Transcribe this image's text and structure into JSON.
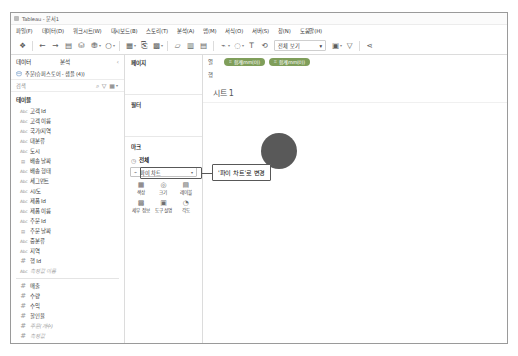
{
  "window": {
    "title": "Tableau - 문서1",
    "logo_icon": "tableau-logo-icon"
  },
  "menubar": {
    "items": [
      {
        "label": "파일(F)"
      },
      {
        "label": "데이터(D)"
      },
      {
        "label": "워크시트(W)"
      },
      {
        "label": "대시보드(B)"
      },
      {
        "label": "스토리(T)"
      },
      {
        "label": "분석(A)"
      },
      {
        "label": "맵(M)"
      },
      {
        "label": "서식(O)"
      },
      {
        "label": "서버(S)"
      },
      {
        "label": "창(N)"
      },
      {
        "label": "도움말(H)"
      }
    ]
  },
  "toolbar": {
    "view_selector_label": "전체 보기",
    "view_selector_caret": "▾",
    "buttons": [
      {
        "name": "tableau-home-icon",
        "glyph": "❖"
      },
      {
        "name": "undo-icon",
        "glyph": "←"
      },
      {
        "name": "redo-icon",
        "glyph": "→"
      },
      {
        "name": "save-icon",
        "glyph": "▤"
      },
      {
        "name": "refresh-data-source-icon",
        "glyph": "⛁"
      },
      {
        "name": "pause-auto-update-icon",
        "glyph": "⛃"
      },
      {
        "name": "run-update-icon",
        "glyph": "○"
      },
      {
        "name": "new-worksheet-icon",
        "glyph": "▦"
      },
      {
        "name": "duplicate-sheet-icon",
        "glyph": "⎘"
      },
      {
        "name": "clear-sheet-icon",
        "glyph": "▩"
      },
      {
        "name": "swap-rows-columns-icon",
        "glyph": "▱"
      },
      {
        "name": "sort-ascending-icon",
        "glyph": "▥"
      },
      {
        "name": "sort-descending-icon",
        "glyph": "▤"
      },
      {
        "name": "highlight-icon",
        "glyph": "⌁"
      },
      {
        "name": "group-members-icon",
        "glyph": "◌"
      },
      {
        "name": "show-mark-labels-icon",
        "glyph": "T"
      },
      {
        "name": "fix-axes-icon",
        "glyph": "⟲"
      },
      {
        "name": "presentation-mode-icon",
        "glyph": "▣"
      },
      {
        "name": "show-me-icon",
        "glyph": "▽"
      },
      {
        "name": "share-icon",
        "glyph": "⋖"
      }
    ]
  },
  "data_pane": {
    "tabs": [
      {
        "label": "데이터",
        "active": true
      },
      {
        "label": "분석",
        "active": false
      }
    ],
    "collapse_icon": "‹",
    "data_source": {
      "icon": "data-source-icon",
      "label": "주문(슈퍼스토어 - 샘플 (4))"
    },
    "search": {
      "label": "검색",
      "search_icon": "⌕",
      "filter_icon": "▽",
      "group_icon": "▦",
      "menu_caret": "▾"
    },
    "fields_header": "테이블",
    "fields": [
      {
        "label": "고객 Id",
        "type": "abc"
      },
      {
        "label": "고객 이름",
        "type": "abc"
      },
      {
        "label": "국가/지역",
        "type": "abc"
      },
      {
        "label": "대분류",
        "type": "abc"
      },
      {
        "label": "도시",
        "type": "abc"
      },
      {
        "label": "배송 날짜",
        "type": "date"
      },
      {
        "label": "배송 형태",
        "type": "abc"
      },
      {
        "label": "세그먼트",
        "type": "abc"
      },
      {
        "label": "시/도",
        "type": "abc"
      },
      {
        "label": "제품 Id",
        "type": "abc"
      },
      {
        "label": "제품 이름",
        "type": "abc"
      },
      {
        "label": "주문 Id",
        "type": "abc"
      },
      {
        "label": "주문 날짜",
        "type": "date"
      },
      {
        "label": "중분류",
        "type": "abc"
      },
      {
        "label": "지역",
        "type": "abc"
      },
      {
        "label": "행 Id",
        "type": "num"
      },
      {
        "label": "측정값 이름",
        "type": "abc",
        "muted": true
      },
      {
        "label": "매출",
        "type": "num"
      },
      {
        "label": "수량",
        "type": "num"
      },
      {
        "label": "수익",
        "type": "num"
      },
      {
        "label": "할인율",
        "type": "num"
      },
      {
        "label": "주문(개수)",
        "type": "num",
        "muted": true
      },
      {
        "label": "측정값",
        "type": "num",
        "muted": true
      }
    ]
  },
  "cards_pane": {
    "pages_header": "페이지",
    "filters_header": "필터",
    "marks_header": "마크",
    "marks": {
      "all_label": "전체",
      "all_icon": "◷",
      "type_glyph": "⌁",
      "type_label": "파이 차트",
      "type_caret": "▾",
      "buttons": [
        {
          "label": "색상",
          "glyph": "▦",
          "name": "marks-color-button"
        },
        {
          "label": "크기",
          "glyph": "◎",
          "name": "marks-size-button"
        },
        {
          "label": "레이블",
          "glyph": "▤",
          "name": "marks-label-button"
        },
        {
          "label": "세부 정보",
          "glyph": "▩",
          "name": "marks-detail-button"
        },
        {
          "label": "도구 설명",
          "glyph": "▣",
          "name": "marks-tooltip-button"
        },
        {
          "label": "각도",
          "glyph": "◔",
          "name": "marks-angle-button"
        }
      ]
    }
  },
  "worksheet": {
    "columns_label": "열",
    "rows_label": "행",
    "column_pills": [
      {
        "label": "합계(mm(0))",
        "dot": "⌗"
      },
      {
        "label": "합계(mm(0))",
        "dot": "⌗"
      }
    ],
    "row_pills": [],
    "sheet_title": "시트 1",
    "pie_color": "#595959"
  },
  "callout": {
    "text": "'파이 차트'로 변경",
    "border_color": "#585858"
  },
  "chart_data": {
    "type": "pie",
    "title": "시트 1",
    "labels": [
      "전체"
    ],
    "values": [
      100
    ],
    "colors": [
      "#595959"
    ],
    "legend": "none",
    "xlabel": "",
    "ylabel": ""
  }
}
